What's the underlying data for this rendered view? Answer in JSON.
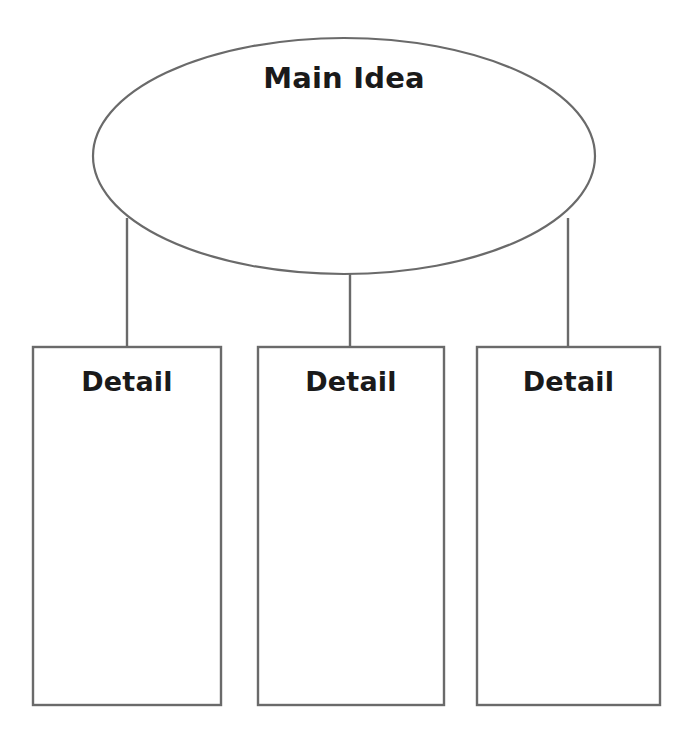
{
  "diagram": {
    "type": "graphic-organizer",
    "background_color": "#ffffff",
    "stroke_color": "#6a6a6a",
    "text_color": "#1a1a1a",
    "stroke_width": 2
  },
  "main_idea": {
    "label": "Main Idea",
    "shape": "ellipse",
    "cx": 344,
    "cy": 156,
    "rx": 251,
    "ry": 118
  },
  "details": [
    {
      "label": "Detail",
      "shape": "rectangle",
      "x": 33,
      "y": 347,
      "width": 188,
      "height": 358,
      "connector_x": 127
    },
    {
      "label": "Detail",
      "shape": "rectangle",
      "x": 258,
      "y": 347,
      "width": 186,
      "height": 358,
      "connector_x": 350
    },
    {
      "label": "Detail",
      "shape": "rectangle",
      "x": 477,
      "y": 347,
      "width": 183,
      "height": 358,
      "connector_x": 568
    }
  ],
  "connectors": [
    {
      "name": "connector-left",
      "x1": 127,
      "y1": 218,
      "x2": 127,
      "y2": 348
    },
    {
      "name": "connector-middle",
      "x1": 350,
      "y1": 272,
      "x2": 350,
      "y2": 348
    },
    {
      "name": "connector-right",
      "x1": 568,
      "y1": 218,
      "x2": 568,
      "y2": 348
    }
  ]
}
